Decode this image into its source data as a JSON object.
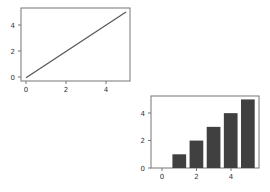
{
  "chart_data": [
    {
      "type": "line",
      "title": "",
      "xlabel": "",
      "ylabel": "",
      "x": [
        0,
        1,
        2,
        3,
        4,
        5
      ],
      "series": [
        {
          "name": "",
          "values": [
            0,
            1,
            2,
            3,
            4,
            5
          ],
          "color": "#555555"
        }
      ],
      "xlim": [
        -0.25,
        5.2
      ],
      "ylim": [
        -0.25,
        5.3
      ],
      "xticks": [
        "0",
        "2",
        "4"
      ],
      "yticks": [
        "0",
        "2",
        "4"
      ],
      "grid": false,
      "legend": null
    },
    {
      "type": "bar",
      "title": "",
      "xlabel": "",
      "ylabel": "",
      "categories": [
        0,
        1,
        2,
        3,
        4,
        5
      ],
      "values": [
        0,
        1,
        2,
        3,
        4,
        5
      ],
      "color": "#404040",
      "xlim": [
        -0.65,
        5.65
      ],
      "ylim": [
        0,
        5.25
      ],
      "xticks": [
        "0",
        "2",
        "4"
      ],
      "yticks": [
        "0",
        "2",
        "4"
      ],
      "grid": false,
      "legend": null
    }
  ],
  "axes": {
    "line": {
      "xtick_labels": [
        "0",
        "2",
        "4"
      ],
      "ytick_labels": [
        "0",
        "2",
        "4"
      ]
    },
    "bar": {
      "xtick_labels": [
        "0",
        "2",
        "4"
      ],
      "ytick_labels": [
        "0",
        "2",
        "4"
      ]
    }
  }
}
